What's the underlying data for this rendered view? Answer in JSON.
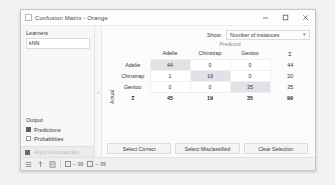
{
  "window": {
    "title": "Confusion Matrix - Orange",
    "app_icon": "app-icon",
    "minimize_label": "—",
    "maximize_label": "□",
    "close_label": "✕"
  },
  "controls": {
    "learners_group": "Learners",
    "learners": [
      "kNN"
    ],
    "output_group": "Output",
    "outputs": [
      {
        "label": "Predictions",
        "checked": true
      },
      {
        "label": "Probabilities",
        "checked": false
      }
    ],
    "apply_label": "Apply Automatically",
    "splitter_handle": "›"
  },
  "show": {
    "label": "Show:",
    "value": "Number of instances",
    "arrow": "▾"
  },
  "matrix": {
    "x_axis_label": "Predicted",
    "y_axis_label": "Actual",
    "sigma": "Σ",
    "classes": [
      "Adelie",
      "Chinstrap",
      "Gentoo"
    ],
    "rows": [
      {
        "label": "Adelie",
        "values": [
          44,
          0,
          0
        ],
        "total": 44
      },
      {
        "label": "Chinstrap",
        "values": [
          1,
          19,
          0
        ],
        "total": 20
      },
      {
        "label": "Gentoo",
        "values": [
          0,
          0,
          35
        ],
        "total": 35
      }
    ],
    "col_totals": [
      45,
      19,
      35
    ],
    "grand_total": 99
  },
  "buttons": {
    "select_correct": "Select Correct",
    "select_misclassified": "Select Misclassified",
    "clear_selection": "Clear Selection"
  },
  "statusbar": {
    "icons": [
      "menu-icon",
      "upload-icon",
      "report-icon"
    ],
    "input_count": "99",
    "output_count": "99",
    "input_prefix": "↑",
    "output_prefix": "↓",
    "separator": "–"
  }
}
